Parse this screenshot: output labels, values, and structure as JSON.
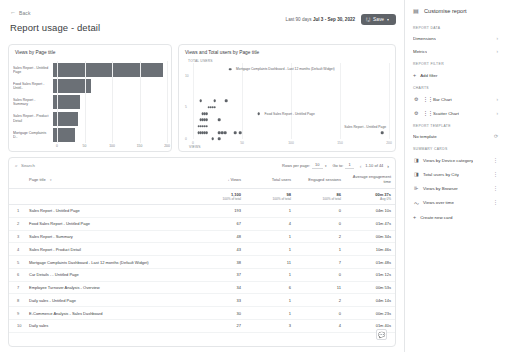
{
  "header": {
    "back_label": "Back",
    "back_icon": "arrow-left-icon",
    "title": "Report usage - detail",
    "date_prefix": "Last 90 days",
    "date_range": "Jul 3 - Sep 30, 2022",
    "save_label": "Save",
    "save_icon": "save-icon",
    "save_caret": "▾"
  },
  "bar_card": {
    "title": "Views by Page title"
  },
  "scatter_card": {
    "title": "Views and Total users by Page title",
    "y_axis_label": "TOTAL USERS",
    "x_axis_label": "VIEWS"
  },
  "chart_data": [
    {
      "type": "bar",
      "orientation": "horizontal",
      "title": "Views by Page title",
      "xlabel": "",
      "ylabel": "",
      "xlim": [
        0,
        200
      ],
      "xticks": [
        0,
        50,
        100,
        150,
        200
      ],
      "grid": true,
      "categories": [
        "Sales Report - Untitled Page",
        "Food Sales Report - Untitl..",
        "Sales Report - Summary",
        "Sales Report - Product Detail",
        "Mortgage Complaints D.."
      ],
      "values": [
        193,
        67,
        48,
        43,
        38
      ]
    },
    {
      "type": "scatter",
      "title": "Views and Total users by Page title",
      "xlabel": "VIEWS",
      "ylabel": "TOTAL USERS",
      "xlim": [
        0,
        200
      ],
      "ylim": [
        0,
        12
      ],
      "xticks": [
        0,
        50,
        100,
        150,
        200
      ],
      "yticks": [
        0,
        5,
        10
      ],
      "grid": true,
      "points": [
        {
          "x": 193,
          "y": 1,
          "label": "Sales Report - Untitled Page"
        },
        {
          "x": 67,
          "y": 4,
          "label": "Food Sales Report - Untitled Page"
        },
        {
          "x": 38,
          "y": 11,
          "label": "Mortgage Complaints Dashboard - Last 12 months (Default Widget)"
        },
        {
          "x": 48,
          "y": 1,
          "label": ""
        },
        {
          "x": 43,
          "y": 1,
          "label": ""
        },
        {
          "x": 27,
          "y": 1,
          "label": ""
        },
        {
          "x": 34,
          "y": 6,
          "label": ""
        },
        {
          "x": 33,
          "y": 1,
          "label": ""
        },
        {
          "x": 30,
          "y": 1,
          "label": ""
        },
        {
          "x": 27,
          "y": 3,
          "label": ""
        },
        {
          "x": 22,
          "y": 5,
          "label": ""
        },
        {
          "x": 20,
          "y": 5,
          "label": ""
        },
        {
          "x": 18,
          "y": 5,
          "label": ""
        },
        {
          "x": 16,
          "y": 5,
          "label": ""
        },
        {
          "x": 14,
          "y": 4,
          "label": ""
        },
        {
          "x": 12,
          "y": 4,
          "label": ""
        },
        {
          "x": 10,
          "y": 4,
          "label": ""
        },
        {
          "x": 14,
          "y": 3,
          "label": ""
        },
        {
          "x": 12,
          "y": 3,
          "label": ""
        },
        {
          "x": 10,
          "y": 3,
          "label": ""
        },
        {
          "x": 8,
          "y": 3,
          "label": ""
        },
        {
          "x": 14,
          "y": 2,
          "label": ""
        },
        {
          "x": 12,
          "y": 2,
          "label": ""
        },
        {
          "x": 10,
          "y": 2,
          "label": ""
        },
        {
          "x": 8,
          "y": 2,
          "label": ""
        },
        {
          "x": 6,
          "y": 2,
          "label": ""
        },
        {
          "x": 14,
          "y": 1,
          "label": ""
        },
        {
          "x": 12,
          "y": 1,
          "label": ""
        },
        {
          "x": 10,
          "y": 1,
          "label": ""
        },
        {
          "x": 8,
          "y": 1,
          "label": ""
        },
        {
          "x": 6,
          "y": 1,
          "label": ""
        },
        {
          "x": 20,
          "y": 0,
          "label": ""
        },
        {
          "x": 27,
          "y": 0,
          "label": ""
        },
        {
          "x": 8,
          "y": 6,
          "label": ""
        },
        {
          "x": 22,
          "y": 6,
          "label": ""
        }
      ]
    }
  ],
  "table": {
    "search_placeholder": "Search",
    "search_icon": "search-icon",
    "rows_per_page_label": "Rows per page:",
    "rows_per_page_value": "10",
    "goto_label": "Go to:",
    "goto_value": "1",
    "range_label": "1-10 of 44",
    "prev_icon": "chevron-left-icon",
    "next_icon": "chevron-right-icon",
    "columns": [
      {
        "key": "dim",
        "label": "Page title",
        "align": "left"
      },
      {
        "key": "views",
        "label": "Views",
        "align": "right",
        "sorted": true
      },
      {
        "key": "users",
        "label": "Total users",
        "align": "right"
      },
      {
        "key": "sessions",
        "label": "Engaged sessions",
        "align": "right"
      },
      {
        "key": "engtime",
        "label": "Average engagement time",
        "align": "right"
      }
    ],
    "totals": {
      "views": "1,100",
      "views_sub": "100% of total",
      "users": "98",
      "users_sub": "100% of total",
      "sessions": "86",
      "sessions_sub": "100% of total",
      "engtime": "00m 37s",
      "engtime_sub": "Avg 0%"
    },
    "rows": [
      {
        "idx": "1",
        "dim": "Sales Report - Untitled Page",
        "views": "193",
        "users": "1",
        "sessions": "0",
        "engtime": "04m 10s"
      },
      {
        "idx": "2",
        "dim": "Food Sales Report - Untitled Page",
        "views": "67",
        "users": "4",
        "sessions": "0",
        "engtime": "01m 47s"
      },
      {
        "idx": "3",
        "dim": "Sales Report - Summary",
        "views": "48",
        "users": "1",
        "sessions": "2",
        "engtime": "00m 34s"
      },
      {
        "idx": "4",
        "dim": "Sales Report - Product Detail",
        "views": "43",
        "users": "1",
        "sessions": "1",
        "engtime": "10m 46s"
      },
      {
        "idx": "5",
        "dim": "Mortgage Complaints Dashboard - Last 12 months (Default Widget)",
        "views": "38",
        "users": "11",
        "sessions": "7",
        "engtime": "01m 48s"
      },
      {
        "idx": "6",
        "dim": "Car Details - - Untitled Page",
        "views": "37",
        "users": "1",
        "sessions": "0",
        "engtime": "01m 12s"
      },
      {
        "idx": "7",
        "dim": "Employee Turnover Analysis - Overview",
        "views": "34",
        "users": "6",
        "sessions": "11",
        "engtime": "00m 53s"
      },
      {
        "idx": "8",
        "dim": "Daily sales - Untitled Page",
        "views": "33",
        "users": "1",
        "sessions": "2",
        "engtime": "04m 14s"
      },
      {
        "idx": "9",
        "dim": "E-Commerce Analysis - Sales Dashboard",
        "views": "30",
        "users": "1",
        "sessions": "0",
        "engtime": "00m 23s"
      },
      {
        "idx": "10",
        "dim": "Daily sales",
        "views": "27",
        "users": "3",
        "sessions": "4",
        "engtime": "01m 40s"
      }
    ],
    "chat_icon": "chat-bubble-icon"
  },
  "sidebar": {
    "title": "Customise report",
    "title_icon": "tune-icon",
    "sections": [
      {
        "label": "Report data",
        "items": [
          {
            "label": "Dimensions",
            "icon": "",
            "trailing": "chevron-right-icon"
          },
          {
            "label": "Metrics",
            "icon": "",
            "trailing": "chevron-right-icon"
          }
        ]
      },
      {
        "label": "Report filter",
        "add": {
          "label": "Add filter",
          "icon": "plus-icon"
        }
      },
      {
        "label": "Charts",
        "items": [
          {
            "label": "Bar Chart",
            "icon": "gear-icon",
            "drag": "drag-handle-icon",
            "trailing": "chevron-right-icon"
          },
          {
            "label": "Scatter Chart",
            "icon": "gear-icon",
            "drag": "drag-handle-icon",
            "trailing": "chevron-right-icon"
          }
        ]
      },
      {
        "label": "Report template",
        "items": [
          {
            "label": "No template",
            "icon": "",
            "trailing": "refresh-icon"
          }
        ]
      },
      {
        "label": "Summary cards",
        "items": [
          {
            "label": "Views by Device category",
            "icon": "chart-icon",
            "trailing": "more-vert-icon"
          },
          {
            "label": "Total users by City",
            "icon": "chart-icon",
            "trailing": "more-vert-icon"
          },
          {
            "label": "Views by Browser",
            "icon": "bar-icon",
            "trailing": "more-vert-icon"
          },
          {
            "label": "Views over time",
            "icon": "line-icon",
            "trailing": "more-vert-icon"
          }
        ],
        "add": {
          "label": "Create new card",
          "icon": "plus-icon"
        }
      }
    ]
  }
}
